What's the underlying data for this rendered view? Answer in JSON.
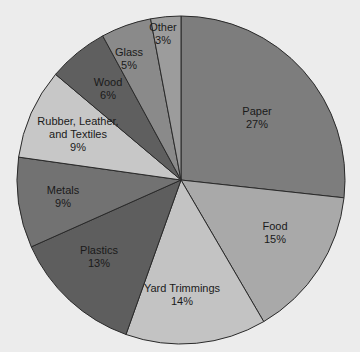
{
  "chart_data": {
    "type": "pie",
    "title": "",
    "center": [
      181,
      180
    ],
    "radius": 164,
    "start_angle_deg": -90,
    "direction": "clockwise",
    "slices": [
      {
        "label": "Paper",
        "value": 27,
        "pct_label": "27%",
        "color": "#7d7d7d",
        "label_lines": [
          "Paper"
        ],
        "label_pos": [
          257,
          117
        ]
      },
      {
        "label": "Food",
        "value": 15,
        "pct_label": "15%",
        "color": "#a9a9a9",
        "label_lines": [
          "Food"
        ],
        "label_pos": [
          275,
          232
        ]
      },
      {
        "label": "Yard Trimmings",
        "value": 14,
        "pct_label": "14%",
        "color": "#c3c3c3",
        "label_lines": [
          "Yard Trimmings"
        ],
        "label_pos": [
          182,
          294
        ]
      },
      {
        "label": "Plastics",
        "value": 13,
        "pct_label": "13%",
        "color": "#5e5e5e",
        "label_lines": [
          "Plastics"
        ],
        "label_pos": [
          99,
          256
        ]
      },
      {
        "label": "Metals",
        "value": 9,
        "pct_label": "9%",
        "color": "#727272",
        "label_lines": [
          "Metals"
        ],
        "label_pos": [
          63,
          196
        ]
      },
      {
        "label": "Rubber, Leather, and Textiles",
        "value": 9,
        "pct_label": "9%",
        "color": "#c7c7c7",
        "label_lines": [
          "Rubber, Leather,",
          "and Textiles"
        ],
        "label_pos": [
          78,
          134
        ]
      },
      {
        "label": "Wood",
        "value": 6,
        "pct_label": "6%",
        "color": "#5f5f5f",
        "label_lines": [
          "Wood"
        ],
        "label_pos": [
          108,
          88
        ]
      },
      {
        "label": "Glass",
        "value": 5,
        "pct_label": "5%",
        "color": "#8a8a8a",
        "label_lines": [
          "Glass"
        ],
        "label_pos": [
          129,
          58
        ]
      },
      {
        "label": "Other",
        "value": 3,
        "pct_label": "3%",
        "color": "#9c9c9c",
        "label_lines": [
          "Other"
        ],
        "label_pos": [
          163,
          33
        ]
      }
    ],
    "stroke_color": "#2a2a2a",
    "legend": "none",
    "background": "#ececec"
  }
}
